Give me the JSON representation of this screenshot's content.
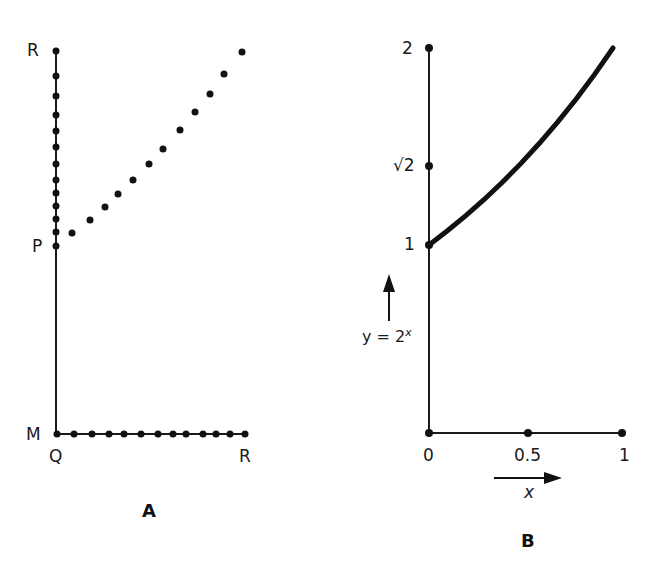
{
  "panelA": {
    "label": "A",
    "labels": {
      "top": "R",
      "middle": "P",
      "corner": "M",
      "origin": "Q",
      "right": "R"
    },
    "vertical_dots_y": [
      51,
      76,
      96,
      115,
      131,
      147,
      164,
      180,
      193,
      206,
      219,
      232,
      246
    ],
    "diagonal_dots": [
      [
        72,
        233
      ],
      [
        90,
        220
      ],
      [
        105,
        207
      ],
      [
        118,
        194
      ],
      [
        133,
        180
      ],
      [
        149,
        164
      ],
      [
        163,
        149
      ],
      [
        180,
        130
      ],
      [
        195,
        112
      ],
      [
        210,
        94
      ],
      [
        224,
        74
      ],
      [
        242,
        52
      ]
    ],
    "horizontal_dots_x": [
      57,
      74,
      92,
      109,
      124,
      141,
      158,
      173,
      186,
      203,
      216,
      230,
      245
    ]
  },
  "panelB": {
    "label": "B",
    "y_ticks": [
      {
        "label": "2",
        "value": 2
      },
      {
        "label": "√2",
        "value": 1.4142
      },
      {
        "label": "1",
        "value": 1
      }
    ],
    "x_ticks": [
      {
        "label": "0",
        "value": 0
      },
      {
        "label": "0.5",
        "value": 0.5
      },
      {
        "label": "1",
        "value": 1
      }
    ],
    "function_label_lhs": "y = 2",
    "function_label_exp": "x",
    "x_axis_label": "x"
  },
  "chart_data": {
    "type": "line",
    "title": "",
    "xlabel": "x",
    "ylabel": "y = 2^x",
    "x": [
      0,
      0.1,
      0.2,
      0.3,
      0.4,
      0.5,
      0.6,
      0.7,
      0.8,
      0.9,
      1.0
    ],
    "series": [
      {
        "name": "y = 2^x",
        "values": [
          1,
          1.072,
          1.149,
          1.231,
          1.32,
          1.414,
          1.516,
          1.625,
          1.741,
          1.866,
          2
        ]
      }
    ],
    "xlim": [
      0,
      1
    ],
    "ylim": [
      0,
      2
    ],
    "x_tick_labels": [
      "0",
      "0.5",
      "1"
    ],
    "y_tick_labels": [
      "1",
      "√2",
      "2"
    ],
    "grid": false
  }
}
